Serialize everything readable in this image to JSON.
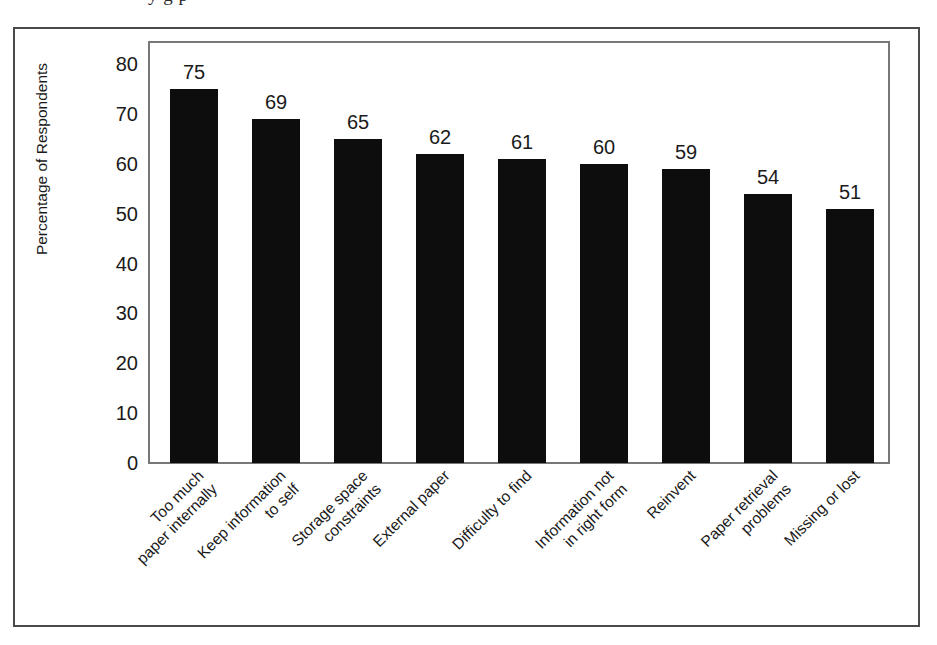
{
  "figure": {
    "top_cut_text": "y g p",
    "background_color": "#ffffff",
    "frame_color": "#4a4a4a",
    "plot_frame_color": "#777777",
    "bar_color": "#0d0d0d"
  },
  "chart_data": {
    "type": "bar",
    "title": "",
    "subtitle": "",
    "xlabel": "",
    "ylabel": "Percentage of Respondents",
    "ylim": [
      0,
      80
    ],
    "ytick_step": 10,
    "yticks": [
      80,
      70,
      60,
      50,
      40,
      30,
      20,
      10,
      0
    ],
    "ytick_labels": [
      "80",
      "70",
      "60",
      "50",
      "40",
      "30",
      "20",
      "10",
      "0"
    ],
    "grid": false,
    "legend": null,
    "orientation": "vertical",
    "value_labels_shown": true,
    "categories": [
      "Too much\npaper internally",
      "Keep information\nto self",
      "Storage space\nconstraints",
      "External paper",
      "Difficulty to find",
      "Information not\nin right form",
      "Reinvent",
      "Paper retrieval\nproblems",
      "Missing or lost"
    ],
    "values": [
      75,
      69,
      65,
      62,
      61,
      60,
      59,
      54,
      51
    ],
    "value_label_text": [
      "75",
      "69",
      "65",
      "62",
      "61",
      "60",
      "59",
      "54",
      "51"
    ]
  }
}
